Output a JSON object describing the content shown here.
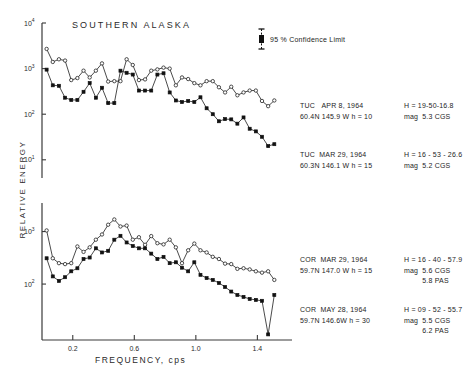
{
  "chart_title": "SOUTHERN  ALASKA",
  "axis": {
    "y_title": "RELATIVE  ENERGY",
    "x_title": "FREQUENCY,  cps",
    "x_ticks": [
      "0.2",
      "0.6",
      "1.0",
      "1.4"
    ],
    "upper_y_ticks": [
      "10",
      "10",
      "10",
      "10"
    ],
    "upper_y_exponents": [
      "4",
      "3",
      "2",
      "1"
    ],
    "lower_y_ticks": [
      "10",
      "10"
    ],
    "lower_y_exponents": [
      "3",
      "2"
    ]
  },
  "legend": {
    "confidence_text": "95 % Confidence  Limit",
    "marker": "error-bar"
  },
  "annotations": [
    {
      "station": "TUC",
      "date": "APR 8, 1964",
      "coords": "60.4N   145.9 W   h = 10",
      "origin_time": "H = 19-50-16.8",
      "mag_label": "mag",
      "magnitudes": [
        "5.3 CGS"
      ]
    },
    {
      "station": "TUC",
      "date": "MAR 29, 1964",
      "coords": "60.3N   146.1 W   h = 15",
      "origin_time": "H = 16 - 53 - 26.6",
      "mag_label": "mag",
      "magnitudes": [
        "5.2 CGS"
      ]
    },
    {
      "station": "COR",
      "date": "MAR 29, 1964",
      "coords": "59.7N   147.0 W   h = 15",
      "origin_time": "H = 16 - 40 - 57.9",
      "mag_label": "mag",
      "magnitudes": [
        "5.6 CGS",
        "5.8 PAS"
      ]
    },
    {
      "station": "COR",
      "date": "MAY 28, 1964",
      "coords": "59.7N   146.6W   h = 30",
      "origin_time": "H = 09 - 52 - 55.7",
      "mag_label": "mag",
      "magnitudes": [
        "5.5 CGS",
        "6.2 PAS"
      ]
    }
  ],
  "chart_data": [
    {
      "type": "line",
      "title": "SOUTHERN ALASKA - TUC spectra",
      "xlabel": "FREQUENCY, cps",
      "ylabel": "RELATIVE ENERGY",
      "yscale": "log",
      "ylim": [
        10,
        10000
      ],
      "xlim": [
        0.0,
        1.56
      ],
      "grid": false,
      "legend_position": "right-annotations",
      "series": [
        {
          "name": "TUC APR 8, 1964",
          "marker": "open-circle",
          "x": [
            0.03,
            0.07,
            0.11,
            0.15,
            0.19,
            0.23,
            0.27,
            0.31,
            0.35,
            0.39,
            0.43,
            0.47,
            0.51,
            0.55,
            0.59,
            0.63,
            0.67,
            0.71,
            0.75,
            0.79,
            0.83,
            0.87,
            0.91,
            0.95,
            0.99,
            1.03,
            1.07,
            1.11,
            1.15,
            1.19,
            1.23,
            1.27,
            1.31,
            1.35,
            1.39,
            1.43,
            1.47,
            1.51
          ],
          "y": [
            2700,
            1400,
            1600,
            1500,
            560,
            620,
            900,
            640,
            900,
            1300,
            520,
            530,
            530,
            1600,
            1200,
            560,
            580,
            900,
            960,
            1050,
            1000,
            430,
            640,
            590,
            480,
            430,
            530,
            530,
            390,
            300,
            400,
            260,
            300,
            330,
            330,
            195,
            150,
            200
          ]
        },
        {
          "name": "TUC MAR 29, 1964",
          "marker": "filled-square",
          "x": [
            0.03,
            0.07,
            0.11,
            0.15,
            0.19,
            0.23,
            0.27,
            0.31,
            0.35,
            0.39,
            0.43,
            0.47,
            0.51,
            0.55,
            0.59,
            0.63,
            0.67,
            0.71,
            0.75,
            0.79,
            0.83,
            0.87,
            0.91,
            0.95,
            0.99,
            1.03,
            1.07,
            1.11,
            1.15,
            1.19,
            1.23,
            1.27,
            1.31,
            1.35,
            1.39,
            1.43,
            1.47,
            1.51
          ],
          "y": [
            950,
            430,
            420,
            230,
            205,
            205,
            310,
            480,
            230,
            380,
            175,
            175,
            900,
            810,
            740,
            330,
            330,
            330,
            740,
            790,
            300,
            200,
            185,
            195,
            185,
            235,
            135,
            100,
            70,
            78,
            77,
            62,
            85,
            48,
            42,
            32,
            20,
            22
          ]
        }
      ]
    },
    {
      "type": "line",
      "title": "SOUTHERN ALASKA - COR spectra",
      "xlabel": "FREQUENCY, cps",
      "ylabel": "RELATIVE ENERGY",
      "yscale": "log",
      "ylim": [
        10,
        10000
      ],
      "xlim": [
        0.0,
        1.56
      ],
      "grid": false,
      "legend_position": "right-annotations",
      "series": [
        {
          "name": "COR MAR 29, 1964",
          "marker": "open-circle",
          "x": [
            0.03,
            0.07,
            0.11,
            0.15,
            0.19,
            0.23,
            0.27,
            0.31,
            0.35,
            0.39,
            0.43,
            0.47,
            0.51,
            0.55,
            0.59,
            0.63,
            0.67,
            0.71,
            0.75,
            0.79,
            0.83,
            0.87,
            0.91,
            0.95,
            0.99,
            1.03,
            1.07,
            1.11,
            1.15,
            1.19,
            1.23,
            1.27,
            1.31,
            1.35,
            1.39,
            1.43,
            1.47,
            1.51
          ],
          "y": [
            1050,
            310,
            250,
            240,
            250,
            520,
            410,
            500,
            700,
            880,
            1350,
            1700,
            1250,
            1300,
            700,
            780,
            560,
            820,
            600,
            570,
            700,
            500,
            250,
            440,
            590,
            440,
            400,
            330,
            300,
            245,
            240,
            195,
            200,
            190,
            175,
            165,
            175,
            120
          ]
        },
        {
          "name": "COR MAY 28, 1964",
          "marker": "filled-square",
          "x": [
            0.03,
            0.07,
            0.11,
            0.15,
            0.19,
            0.23,
            0.27,
            0.31,
            0.35,
            0.39,
            0.43,
            0.47,
            0.51,
            0.55,
            0.59,
            0.63,
            0.67,
            0.71,
            0.75,
            0.79,
            0.83,
            0.87,
            0.91,
            0.95,
            0.99,
            1.03,
            1.07,
            1.11,
            1.15,
            1.19,
            1.23,
            1.27,
            1.31,
            1.35,
            1.39,
            1.43,
            1.47,
            1.51
          ],
          "y": [
            310,
            140,
            115,
            135,
            175,
            200,
            300,
            320,
            480,
            400,
            430,
            700,
            830,
            620,
            530,
            480,
            480,
            380,
            300,
            330,
            250,
            260,
            205,
            175,
            260,
            150,
            130,
            120,
            105,
            88,
            72,
            62,
            57,
            52,
            50,
            48,
            11,
            62
          ]
        }
      ]
    }
  ]
}
